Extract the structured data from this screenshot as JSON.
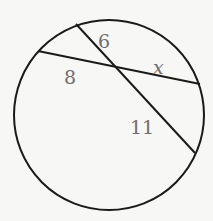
{
  "diagram": {
    "type": "intersecting-chords-in-circle",
    "circle": {
      "cx": 109,
      "cy": 115,
      "r": 95
    },
    "chords": [
      {
        "name": "chord-a",
        "x1": 38,
        "y1": 51,
        "x2": 200,
        "y2": 84
      },
      {
        "name": "chord-b",
        "x1": 76,
        "y1": 24,
        "x2": 195,
        "y2": 153
      }
    ],
    "segment_labels": [
      {
        "text": "6",
        "x": 98,
        "y": 48
      },
      {
        "text": "8",
        "x": 64,
        "y": 84
      },
      {
        "text": "x",
        "x": 153,
        "y": 74
      },
      {
        "text": "11",
        "x": 130,
        "y": 134
      }
    ],
    "stroke_color": "#1a1a1a",
    "label_color": "#6e6e6e"
  }
}
